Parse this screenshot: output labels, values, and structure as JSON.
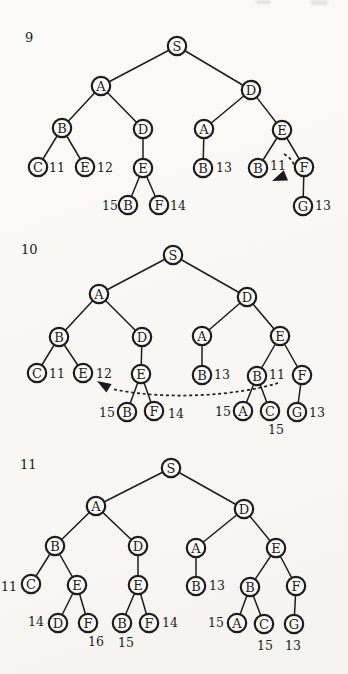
{
  "page": {
    "background": "#faf9f6",
    "ink": "#1c1c1c"
  },
  "figures": [
    {
      "figure_number": "9",
      "number_pos": {
        "x": 29,
        "y": 38
      },
      "nodes": [
        {
          "id": "S",
          "label": "S",
          "x": 177,
          "y": 46
        },
        {
          "id": "A1",
          "label": "A",
          "x": 101,
          "y": 86
        },
        {
          "id": "D1",
          "label": "D",
          "x": 251,
          "y": 90
        },
        {
          "id": "B1",
          "label": "B",
          "x": 62,
          "y": 128
        },
        {
          "id": "D2",
          "label": "D",
          "x": 143,
          "y": 129
        },
        {
          "id": "C1",
          "label": "C",
          "x": 38,
          "y": 167
        },
        {
          "id": "E1",
          "label": "E",
          "x": 85,
          "y": 167
        },
        {
          "id": "E2",
          "label": "E",
          "x": 143,
          "y": 168
        },
        {
          "id": "B2",
          "label": "B",
          "x": 128,
          "y": 205
        },
        {
          "id": "F1",
          "label": "F",
          "x": 159,
          "y": 205
        },
        {
          "id": "A2",
          "label": "A",
          "x": 204,
          "y": 129
        },
        {
          "id": "E3",
          "label": "E",
          "x": 282,
          "y": 130
        },
        {
          "id": "B3",
          "label": "B",
          "x": 203,
          "y": 168
        },
        {
          "id": "B4",
          "label": "B",
          "x": 258,
          "y": 168
        },
        {
          "id": "F2",
          "label": "F",
          "x": 304,
          "y": 167
        },
        {
          "id": "G1",
          "label": "G",
          "x": 303,
          "y": 206
        }
      ],
      "edges": [
        [
          "S",
          "A1"
        ],
        [
          "S",
          "D1"
        ],
        [
          "A1",
          "B1"
        ],
        [
          "A1",
          "D2"
        ],
        [
          "B1",
          "C1"
        ],
        [
          "B1",
          "E1"
        ],
        [
          "D2",
          "E2"
        ],
        [
          "E2",
          "B2"
        ],
        [
          "E2",
          "F1"
        ],
        [
          "D1",
          "A2"
        ],
        [
          "D1",
          "E3"
        ],
        [
          "A2",
          "B3"
        ],
        [
          "E3",
          "B4"
        ],
        [
          "E3",
          "F2"
        ],
        [
          "F2",
          "G1"
        ]
      ],
      "values": [
        {
          "value": "11",
          "x": 57,
          "y": 168
        },
        {
          "value": "12",
          "x": 105,
          "y": 168
        },
        {
          "value": "15",
          "x": 110,
          "y": 206
        },
        {
          "value": "14",
          "x": 178,
          "y": 206
        },
        {
          "value": "13",
          "x": 224,
          "y": 168
        },
        {
          "value": "11",
          "x": 278,
          "y": 166
        },
        {
          "value": "13",
          "x": 323,
          "y": 206
        }
      ],
      "arrows": [
        {
          "path": "M 284 154 Q 296 161 295 173",
          "head": "272,181 283.8,170.2 288,180.4"
        }
      ]
    },
    {
      "figure_number": "10",
      "number_pos": {
        "x": 29,
        "y": 250
      },
      "nodes": [
        {
          "id": "S",
          "label": "S",
          "x": 173,
          "y": 255
        },
        {
          "id": "A1",
          "label": "A",
          "x": 99,
          "y": 294
        },
        {
          "id": "D1",
          "label": "D",
          "x": 247,
          "y": 297
        },
        {
          "id": "B1",
          "label": "B",
          "x": 59,
          "y": 337
        },
        {
          "id": "D2",
          "label": "D",
          "x": 142,
          "y": 337
        },
        {
          "id": "C1",
          "label": "C",
          "x": 37,
          "y": 373
        },
        {
          "id": "E1",
          "label": "E",
          "x": 83,
          "y": 373
        },
        {
          "id": "E2",
          "label": "E",
          "x": 141,
          "y": 374
        },
        {
          "id": "B2",
          "label": "B",
          "x": 127,
          "y": 412
        },
        {
          "id": "F1",
          "label": "F",
          "x": 154,
          "y": 411
        },
        {
          "id": "A2",
          "label": "A",
          "x": 202,
          "y": 336
        },
        {
          "id": "E3",
          "label": "E",
          "x": 280,
          "y": 336
        },
        {
          "id": "B3",
          "label": "B",
          "x": 202,
          "y": 375
        },
        {
          "id": "B4",
          "label": "B",
          "x": 257,
          "y": 376
        },
        {
          "id": "F2",
          "label": "F",
          "x": 302,
          "y": 375
        },
        {
          "id": "A3",
          "label": "A",
          "x": 243,
          "y": 411
        },
        {
          "id": "C2",
          "label": "C",
          "x": 270,
          "y": 411
        },
        {
          "id": "G1",
          "label": "G",
          "x": 297,
          "y": 412
        }
      ],
      "edges": [
        [
          "S",
          "A1"
        ],
        [
          "S",
          "D1"
        ],
        [
          "A1",
          "B1"
        ],
        [
          "A1",
          "D2"
        ],
        [
          "B1",
          "C1"
        ],
        [
          "B1",
          "E1"
        ],
        [
          "D2",
          "E2"
        ],
        [
          "E2",
          "B2"
        ],
        [
          "E2",
          "F1"
        ],
        [
          "D1",
          "A2"
        ],
        [
          "D1",
          "E3"
        ],
        [
          "A2",
          "B3"
        ],
        [
          "E3",
          "B4"
        ],
        [
          "E3",
          "F2"
        ],
        [
          "B4",
          "A3"
        ],
        [
          "B4",
          "C2"
        ],
        [
          "F2",
          "G1"
        ]
      ],
      "values": [
        {
          "value": "11",
          "x": 57,
          "y": 374
        },
        {
          "value": "12",
          "x": 104,
          "y": 374
        },
        {
          "value": "15",
          "x": 107,
          "y": 413
        },
        {
          "value": "14",
          "x": 176,
          "y": 414
        },
        {
          "value": "13",
          "x": 222,
          "y": 375
        },
        {
          "value": "11",
          "x": 277,
          "y": 375
        },
        {
          "value": "15",
          "x": 223,
          "y": 412
        },
        {
          "value": "15",
          "x": 276,
          "y": 430
        },
        {
          "value": "13",
          "x": 317,
          "y": 413
        }
      ],
      "arrows": [
        {
          "path": "M 278 383 C 240 395 168 401 112 389",
          "head": "97,381 111.6,383.9 106.4,392.5"
        }
      ]
    },
    {
      "figure_number": "11",
      "number_pos": {
        "x": 27,
        "y": 465
      },
      "nodes": [
        {
          "id": "S",
          "label": "S",
          "x": 171,
          "y": 468
        },
        {
          "id": "A1",
          "label": "A",
          "x": 96,
          "y": 506
        },
        {
          "id": "D1",
          "label": "D",
          "x": 244,
          "y": 509
        },
        {
          "id": "B1",
          "label": "B",
          "x": 55,
          "y": 546
        },
        {
          "id": "D2",
          "label": "D",
          "x": 138,
          "y": 546
        },
        {
          "id": "C1",
          "label": "C",
          "x": 31,
          "y": 584
        },
        {
          "id": "E1",
          "label": "E",
          "x": 77,
          "y": 585
        },
        {
          "id": "D3",
          "label": "D",
          "x": 58,
          "y": 623
        },
        {
          "id": "F1",
          "label": "F",
          "x": 88,
          "y": 623
        },
        {
          "id": "E2",
          "label": "E",
          "x": 138,
          "y": 585
        },
        {
          "id": "B2",
          "label": "B",
          "x": 122,
          "y": 623
        },
        {
          "id": "F2",
          "label": "F",
          "x": 149,
          "y": 623
        },
        {
          "id": "A2",
          "label": "A",
          "x": 196,
          "y": 548
        },
        {
          "id": "E3",
          "label": "E",
          "x": 276,
          "y": 548
        },
        {
          "id": "B3",
          "label": "B",
          "x": 196,
          "y": 586
        },
        {
          "id": "B4",
          "label": "B",
          "x": 250,
          "y": 587
        },
        {
          "id": "F3",
          "label": "F",
          "x": 296,
          "y": 586
        },
        {
          "id": "A3",
          "label": "A",
          "x": 237,
          "y": 623
        },
        {
          "id": "C2",
          "label": "C",
          "x": 264,
          "y": 624
        },
        {
          "id": "G1",
          "label": "G",
          "x": 294,
          "y": 624
        }
      ],
      "edges": [
        [
          "S",
          "A1"
        ],
        [
          "S",
          "D1"
        ],
        [
          "A1",
          "B1"
        ],
        [
          "A1",
          "D2"
        ],
        [
          "B1",
          "C1"
        ],
        [
          "B1",
          "E1"
        ],
        [
          "E1",
          "D3"
        ],
        [
          "E1",
          "F1"
        ],
        [
          "D2",
          "E2"
        ],
        [
          "E2",
          "B2"
        ],
        [
          "E2",
          "F2"
        ],
        [
          "D1",
          "A2"
        ],
        [
          "D1",
          "E3"
        ],
        [
          "A2",
          "B3"
        ],
        [
          "E3",
          "B4"
        ],
        [
          "E3",
          "F3"
        ],
        [
          "B4",
          "A3"
        ],
        [
          "B4",
          "C2"
        ],
        [
          "F3",
          "G1"
        ]
      ],
      "values": [
        {
          "value": "11",
          "x": 9,
          "y": 587
        },
        {
          "value": "14",
          "x": 36,
          "y": 622
        },
        {
          "value": "16",
          "x": 96,
          "y": 642
        },
        {
          "value": "15",
          "x": 126,
          "y": 643
        },
        {
          "value": "14",
          "x": 170,
          "y": 623
        },
        {
          "value": "13",
          "x": 217,
          "y": 586
        },
        {
          "value": "15",
          "x": 216,
          "y": 623
        },
        {
          "value": "15",
          "x": 265,
          "y": 646
        },
        {
          "value": "13",
          "x": 293,
          "y": 646
        }
      ],
      "arrows": []
    }
  ]
}
